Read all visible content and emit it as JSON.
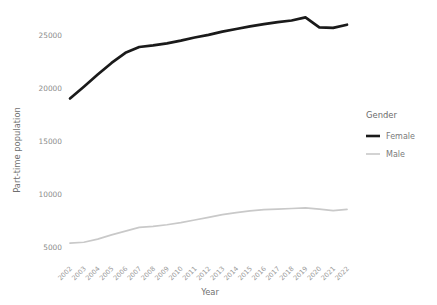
{
  "chart_data": {
    "type": "line",
    "title": "",
    "xlabel": "Year",
    "ylabel": "Part-time population",
    "x": [
      2002,
      2003,
      2004,
      2005,
      2006,
      2007,
      2008,
      2009,
      2010,
      2011,
      2012,
      2013,
      2014,
      2015,
      2016,
      2017,
      2018,
      2019,
      2020,
      2021,
      2022
    ],
    "xticklabels": [
      "2002",
      "2003",
      "2004",
      "2005",
      "2006",
      "2007",
      "2008",
      "2009",
      "2010",
      "2011",
      "2012",
      "2013",
      "2014",
      "2015",
      "2016",
      "2017",
      "2018",
      "2019",
      "2020",
      "2021",
      "2022"
    ],
    "yticks": [
      5000,
      10000,
      15000,
      20000,
      25000
    ],
    "yticklabels": [
      "5000",
      "10000",
      "15000",
      "20000",
      "25000"
    ],
    "ylim": [
      4300,
      27200
    ],
    "xlim": [
      2002,
      2022
    ],
    "grid": false,
    "legend": {
      "title": "Gender",
      "position": "right",
      "entries": [
        {
          "name": "Female",
          "color": "#1a1a1a",
          "width": 2.6
        },
        {
          "name": "Male",
          "color": "#c9c9c9",
          "width": 1.6
        }
      ]
    },
    "series": [
      {
        "name": "Female",
        "color": "#1a1a1a",
        "values": [
          19050,
          20150,
          21300,
          22400,
          23350,
          23900,
          24050,
          24250,
          24500,
          24800,
          25050,
          25350,
          25600,
          25850,
          26050,
          26250,
          26400,
          26700,
          25750,
          25700,
          26000
        ]
      },
      {
        "name": "Male",
        "color": "#c9c9c9",
        "values": [
          5420,
          5500,
          5800,
          6200,
          6550,
          6900,
          7000,
          7150,
          7350,
          7600,
          7850,
          8100,
          8300,
          8450,
          8570,
          8620,
          8680,
          8750,
          8620,
          8480,
          8600
        ]
      }
    ]
  },
  "axes": {
    "y_title": "Part-time population",
    "x_title": "Year"
  }
}
